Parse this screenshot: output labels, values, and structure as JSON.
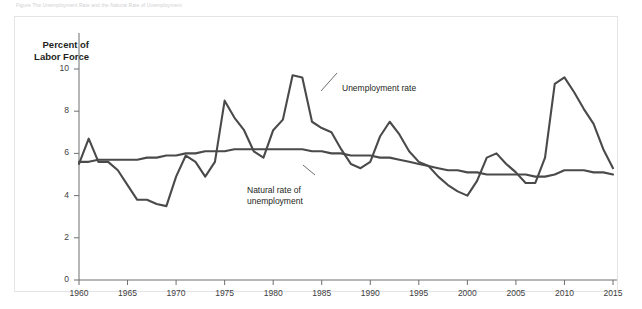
{
  "figure": {
    "caption_above": "Figure   The Unemployment Rate and the Natural Rate of Unemployment",
    "panel_border_color": "#e4e4e8",
    "background": "#ffffff"
  },
  "axes": {
    "y_title_line1": "Percent of",
    "y_title_line2": "Labor Force",
    "y_ticks": [
      "10",
      "8",
      "6",
      "4",
      "2",
      "0"
    ],
    "y_tick_values": [
      10,
      8,
      6,
      4,
      2,
      0
    ],
    "x_ticks": [
      "1960",
      "1965",
      "1970",
      "1975",
      "1980",
      "1985",
      "1990",
      "1995",
      "2000",
      "2005",
      "2010",
      "2015"
    ],
    "x_tick_values": [
      1960,
      1965,
      1970,
      1975,
      1980,
      1985,
      1990,
      1995,
      2000,
      2005,
      2010,
      2015
    ],
    "axis_color": "#6d6e71",
    "tick_label_color": "#414042"
  },
  "annotations": [
    {
      "name": "unemployment-rate",
      "line1": "Unemployment rate",
      "line2": ""
    },
    {
      "name": "natural-rate",
      "line1": "Natural rate of",
      "line2": "unemployment"
    }
  ],
  "chart_data": {
    "type": "line",
    "title": "",
    "xlabel": "",
    "ylabel": "Percent of Labor Force",
    "xlim": [
      1960,
      2015
    ],
    "ylim": [
      0,
      11
    ],
    "grid": false,
    "legend": "annotations on plot",
    "line_color": "#4a4a4a",
    "x": [
      1960,
      1961,
      1962,
      1963,
      1964,
      1965,
      1966,
      1967,
      1968,
      1969,
      1970,
      1971,
      1972,
      1973,
      1974,
      1975,
      1976,
      1977,
      1978,
      1979,
      1980,
      1981,
      1982,
      1983,
      1984,
      1985,
      1986,
      1987,
      1988,
      1989,
      1990,
      1991,
      1992,
      1993,
      1994,
      1995,
      1996,
      1997,
      1998,
      1999,
      2000,
      2001,
      2002,
      2003,
      2004,
      2005,
      2006,
      2007,
      2008,
      2009,
      2010,
      2011,
      2012,
      2013,
      2014,
      2015
    ],
    "series": [
      {
        "name": "Unemployment rate",
        "values": [
          5.5,
          6.7,
          5.6,
          5.6,
          5.2,
          4.5,
          3.8,
          3.8,
          3.6,
          3.5,
          4.9,
          5.9,
          5.6,
          4.9,
          5.6,
          8.5,
          7.7,
          7.1,
          6.1,
          5.8,
          7.1,
          7.6,
          9.7,
          9.6,
          7.5,
          7.2,
          7.0,
          6.2,
          5.5,
          5.3,
          5.6,
          6.8,
          7.5,
          6.9,
          6.1,
          5.6,
          5.4,
          4.9,
          4.5,
          4.2,
          4.0,
          4.7,
          5.8,
          6.0,
          5.5,
          5.1,
          4.6,
          4.6,
          5.8,
          9.3,
          9.6,
          8.9,
          8.1,
          7.4,
          6.2,
          5.3
        ]
      },
      {
        "name": "Natural rate of unemployment",
        "values": [
          5.6,
          5.6,
          5.7,
          5.7,
          5.7,
          5.7,
          5.7,
          5.8,
          5.8,
          5.9,
          5.9,
          6.0,
          6.0,
          6.1,
          6.1,
          6.1,
          6.2,
          6.2,
          6.2,
          6.2,
          6.2,
          6.2,
          6.2,
          6.2,
          6.1,
          6.1,
          6.0,
          6.0,
          5.9,
          5.9,
          5.9,
          5.8,
          5.8,
          5.7,
          5.6,
          5.5,
          5.4,
          5.3,
          5.2,
          5.2,
          5.1,
          5.1,
          5.0,
          5.0,
          5.0,
          5.0,
          5.0,
          4.9,
          4.9,
          5.0,
          5.2,
          5.2,
          5.2,
          5.1,
          5.1,
          5.0
        ]
      }
    ]
  }
}
